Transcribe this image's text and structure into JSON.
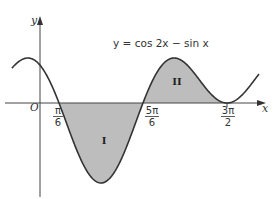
{
  "figure": {
    "equation": "y = cos 2x − sin x",
    "axes": {
      "x_label": "x",
      "y_label": "y",
      "origin_label": "O"
    },
    "ticks": [
      {
        "num": "π",
        "den": "6",
        "value_rad": 0.5236
      },
      {
        "num": "5π",
        "den": "6",
        "value_rad": 2.618
      },
      {
        "num": "3π",
        "den": "2",
        "value_rad": 4.7124
      }
    ],
    "regions": [
      {
        "label": "I",
        "from_rad": 0.5236,
        "to_rad": 2.618,
        "position": "below x-axis"
      },
      {
        "label": "II",
        "from_rad": 2.618,
        "to_rad": 4.7124,
        "position": "above x-axis"
      }
    ],
    "curve": {
      "function": "cos(2x) - sin(x)",
      "t_min": -0.65,
      "t_max": 5.51
    },
    "colors": {
      "curve": "#333333",
      "shade": "#bdbdbd",
      "axis": "#444444",
      "text": "#333333"
    }
  }
}
